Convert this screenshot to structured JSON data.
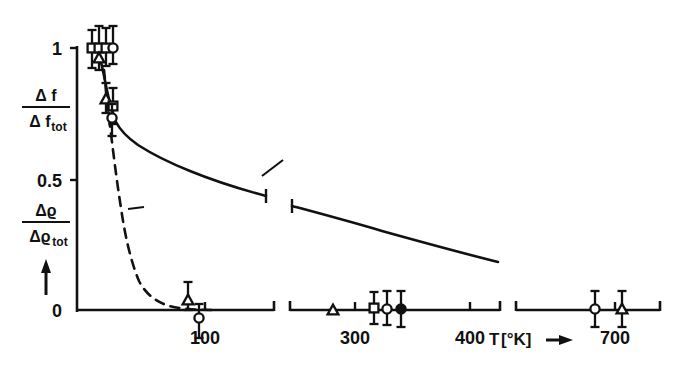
{
  "figure": {
    "background": "#ffffff",
    "ink": "#111111",
    "caption_none": ""
  },
  "axes": {
    "y": {
      "label_top": "Δ f",
      "label_top_den": "Δ f",
      "label_top_den_sub": "tot",
      "label_bottom": "Δϱ",
      "label_bottom_den": "Δϱ",
      "label_bottom_den_sub": "tot",
      "ticks": [
        {
          "value": "1",
          "y_px": 48
        },
        {
          "value": "0.5",
          "y_px": 180
        },
        {
          "value": "0",
          "y_px": 310
        }
      ],
      "arrow_up": "↑",
      "range": [
        0,
        1.08
      ]
    },
    "x": {
      "unit_label": "T",
      "unit_brackets": "[°K]",
      "unit_arrow": "→",
      "ticks": [
        {
          "value": "100",
          "x_px": 205
        },
        {
          "value": "300",
          "x_px": 355
        },
        {
          "value": "400",
          "x_px": 470
        },
        {
          "value": "700",
          "x_px": 615
        }
      ],
      "broken": true,
      "segments": [
        {
          "name": "segment-low",
          "x0_px": 77,
          "x1_px": 274
        },
        {
          "name": "segment-mid",
          "x0_px": 290,
          "x1_px": 500
        },
        {
          "name": "segment-high",
          "x0_px": 516,
          "x1_px": 660
        }
      ]
    }
  },
  "curves": {
    "rho": {
      "label": "ϱ",
      "style": "solid",
      "label_x_px": 288,
      "label_y_px": 152,
      "leader": "M 262 176 L 283 160",
      "seg1": "M 98 52 C 101 60 103 70 106 86 C 109 100 112 112 116 122 C 121 132 128 138 138 145 C 152 154 170 163 190 171 C 212 180 240 189 266 196",
      "seg2": "M 292 206 C 318 213 348 221 382 231 C 418 241 458 252 498 262"
    },
    "f": {
      "label": "f",
      "style": "dashed",
      "label_x_px": 150,
      "label_y_px": 212,
      "leader": "M 128 209 L 144 207",
      "path": "M 104 70 C 106 90 108 112 111 134 C 114 158 117 183 121 208 C 125 236 131 262 139 281 C 148 298 162 306 180 308 C 196 310 208 310 216 310"
    }
  },
  "legend_none": [],
  "chart_data": {
    "type": "scatter",
    "title": "",
    "xlabel": "T [°K]",
    "ylabel": "Δf/Δf_tot , Δϱ/Δϱ_tot",
    "xlim": [
      0,
      750
    ],
    "ylim": [
      0,
      1.08
    ],
    "grid": false,
    "legend_position": "inline-curve-labels",
    "broken_x_axis": true,
    "x_breaks": [
      [
        150,
        280
      ],
      [
        420,
        650
      ]
    ],
    "xticks": [
      100,
      300,
      400,
      700
    ],
    "yticks": [
      0,
      0.5,
      1
    ],
    "series": [
      {
        "name": "ϱ (resistivity, solid curve)",
        "type": "line",
        "style": "solid",
        "x": [
          2,
          5,
          8,
          11,
          14,
          18,
          22,
          26,
          30,
          36,
          44,
          55,
          70,
          90,
          110,
          130,
          150,
          280,
          310,
          340,
          370,
          400,
          420
        ],
        "y": [
          1.02,
          1.0,
          0.96,
          0.91,
          0.86,
          0.8,
          0.75,
          0.71,
          0.68,
          0.645,
          0.61,
          0.575,
          0.545,
          0.515,
          0.49,
          0.47,
          0.455,
          0.385,
          0.36,
          0.335,
          0.31,
          0.285,
          0.265
        ]
      },
      {
        "name": "f (frequency shift, dashed curve)",
        "type": "line",
        "style": "dashed",
        "x": [
          5,
          10,
          15,
          20,
          25,
          30,
          35,
          40,
          45,
          50,
          55,
          60,
          70,
          80,
          90,
          100
        ],
        "y": [
          1.0,
          0.9,
          0.78,
          0.66,
          0.55,
          0.44,
          0.34,
          0.25,
          0.18,
          0.12,
          0.08,
          0.05,
          0.02,
          0.01,
          0.0,
          0.0
        ]
      }
    ],
    "points": [
      {
        "marker": "square",
        "x": 6,
        "y": 1.0,
        "yerr": 0.1
      },
      {
        "marker": "square",
        "x": 10,
        "y": 1.0,
        "yerr": 0.1
      },
      {
        "marker": "square",
        "x": 14,
        "y": 1.0,
        "yerr": 0.09
      },
      {
        "marker": "triangle-up",
        "x": 10,
        "y": 0.95,
        "yerr": 0.08
      },
      {
        "marker": "open-circle",
        "x": 18,
        "y": 1.0,
        "yerr": 0.1
      },
      {
        "marker": "triangle-up",
        "x": 26,
        "y": 0.79,
        "yerr": 0.09
      },
      {
        "marker": "square",
        "x": 30,
        "y": 0.74,
        "yerr": 0.09
      },
      {
        "marker": "open-circle",
        "x": 30,
        "y": 0.69,
        "yerr": 0.1
      },
      {
        "marker": "triangle-up",
        "x": 88,
        "y": 0.03,
        "yerr": 0.06
      },
      {
        "marker": "open-circle",
        "x": 94,
        "y": 0.0,
        "yerr": 0.07
      },
      {
        "marker": "triangle-up",
        "x": 290,
        "y": 0.0,
        "yerr": 0.0
      },
      {
        "marker": "square",
        "x": 330,
        "y": 0.01,
        "yerr": 0.06
      },
      {
        "marker": "open-circle",
        "x": 344,
        "y": 0.01,
        "yerr": 0.06
      },
      {
        "marker": "filled-circle",
        "x": 358,
        "y": 0.01,
        "yerr": 0.06
      },
      {
        "marker": "open-circle",
        "x": 690,
        "y": 0.01,
        "yerr": 0.06
      },
      {
        "marker": "triangle-up",
        "x": 712,
        "y": 0.01,
        "yerr": 0.06
      }
    ]
  },
  "markers_px": {
    "comment_none": "",
    "items": [
      {
        "name": "point-square-a",
        "shape": "square",
        "cx": 92,
        "cy": 48,
        "err_top": 18,
        "err_bot": 20
      },
      {
        "name": "point-square-b",
        "shape": "square",
        "cx": 99,
        "cy": 48,
        "err_top": 22,
        "err_bot": 22
      },
      {
        "name": "point-square-c",
        "shape": "square",
        "cx": 106,
        "cy": 48,
        "err_top": 20,
        "err_bot": 18
      },
      {
        "name": "point-triangle-a",
        "shape": "triangle",
        "cx": 99,
        "cy": 58,
        "err_top": 0,
        "err_bot": 0
      },
      {
        "name": "point-circle-a",
        "shape": "open-circle",
        "cx": 113,
        "cy": 48,
        "err_top": 22,
        "err_bot": 16
      },
      {
        "name": "point-triangle-b",
        "shape": "triangle",
        "cx": 106,
        "cy": 99,
        "err_top": 16,
        "err_bot": 14
      },
      {
        "name": "point-square-d",
        "shape": "square",
        "cx": 113,
        "cy": 106,
        "err_top": 18,
        "err_bot": 18
      },
      {
        "name": "point-circle-b",
        "shape": "open-circle",
        "cx": 112,
        "cy": 118,
        "err_top": 14,
        "err_bot": 18
      },
      {
        "name": "point-triangle-c",
        "shape": "triangle",
        "cx": 188,
        "cy": 300,
        "err_top": 18,
        "err_bot": 10
      },
      {
        "name": "point-circle-c",
        "shape": "open-circle",
        "cx": 199,
        "cy": 318,
        "err_top": 14,
        "err_bot": 20
      },
      {
        "name": "point-triangle-d",
        "shape": "triangle",
        "cx": 333,
        "cy": 310,
        "err_top": 0,
        "err_bot": 0
      },
      {
        "name": "point-square-e",
        "shape": "square",
        "cx": 374,
        "cy": 308,
        "err_top": 16,
        "err_bot": 16
      },
      {
        "name": "point-circle-d",
        "shape": "open-circle",
        "cx": 387,
        "cy": 309,
        "err_top": 18,
        "err_bot": 16
      },
      {
        "name": "point-circle-filled-a",
        "shape": "filled-circle",
        "cx": 401,
        "cy": 309,
        "err_top": 18,
        "err_bot": 18
      },
      {
        "name": "point-circle-e",
        "shape": "open-circle",
        "cx": 595,
        "cy": 309,
        "err_top": 18,
        "err_bot": 18
      },
      {
        "name": "point-triangle-e",
        "shape": "triangle",
        "cx": 622,
        "cy": 309,
        "err_top": 18,
        "err_bot": 18
      }
    ]
  }
}
